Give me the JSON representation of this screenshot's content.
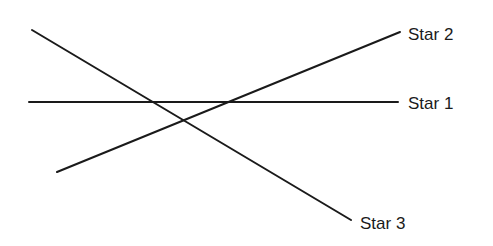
{
  "diagram": {
    "lines": [
      {
        "id": "star-1",
        "label": "Star 1",
        "x1": 29,
        "y1": 102,
        "x2": 398,
        "y2": 102,
        "label_x": 408,
        "label_y": 109
      },
      {
        "id": "star-2",
        "label": "Star 2",
        "x1": 57,
        "y1": 172,
        "x2": 400,
        "y2": 32,
        "label_x": 408,
        "label_y": 40
      },
      {
        "id": "star-3",
        "label": "Star 3",
        "x1": 32,
        "y1": 30,
        "x2": 351,
        "y2": 220,
        "label_x": 360,
        "label_y": 229
      }
    ],
    "stroke_color": "#1a1a1a"
  }
}
